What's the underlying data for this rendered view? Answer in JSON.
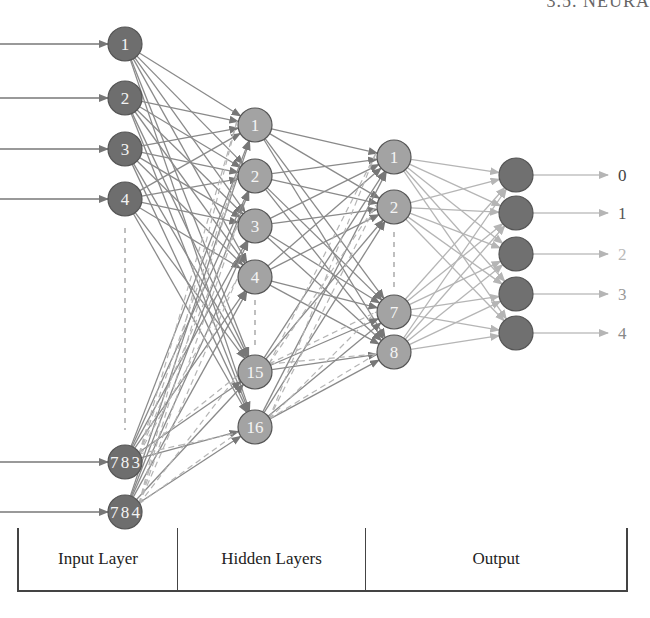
{
  "header": {
    "text": "3.5. NEURA"
  },
  "colors": {
    "input_node": "#6e6e6e",
    "hidden_node": "#a3a3a3",
    "output_node": "#707070",
    "edge": "#8a8a8a",
    "edge_light": "#b5b5b5",
    "node_stroke": "#555555"
  },
  "layers": {
    "input": {
      "x": 125,
      "nodes": [
        {
          "label": "1",
          "y": 44
        },
        {
          "label": "2",
          "y": 98
        },
        {
          "label": "3",
          "y": 149
        },
        {
          "label": "4",
          "y": 199
        },
        {
          "label": "783",
          "y": 462
        },
        {
          "label": "784",
          "y": 512
        }
      ],
      "ellipsis": {
        "y1": 228,
        "y2": 430
      }
    },
    "hidden1": {
      "x": 255,
      "nodes": [
        {
          "label": "1",
          "y": 125
        },
        {
          "label": "2",
          "y": 176
        },
        {
          "label": "3",
          "y": 226
        },
        {
          "label": "4",
          "y": 277
        },
        {
          "label": "15",
          "y": 372
        },
        {
          "label": "16",
          "y": 427
        }
      ],
      "ellipsis": {
        "y1": 300,
        "y2": 347
      }
    },
    "hidden2": {
      "x": 394,
      "nodes": [
        {
          "label": "1",
          "y": 157
        },
        {
          "label": "2",
          "y": 207
        },
        {
          "label": "7",
          "y": 312
        },
        {
          "label": "8",
          "y": 352
        }
      ],
      "ellipsis": {
        "y1": 232,
        "y2": 287
      }
    },
    "output": {
      "x": 516,
      "nodes": [
        {
          "label": "0",
          "y": 175
        },
        {
          "label": "1",
          "y": 213
        },
        {
          "label": "2",
          "y": 254
        },
        {
          "label": "3",
          "y": 294
        },
        {
          "label": "4",
          "y": 333
        }
      ],
      "label_colors": [
        "#444444",
        "#555555",
        "#b8b8b8",
        "#999999",
        "#888888"
      ]
    }
  },
  "legend": {
    "cells": [
      {
        "label": "Input Layer",
        "width": 158
      },
      {
        "label": "Hidden Layers",
        "width": 188
      },
      {
        "label": "Output",
        "width": 265
      }
    ]
  }
}
